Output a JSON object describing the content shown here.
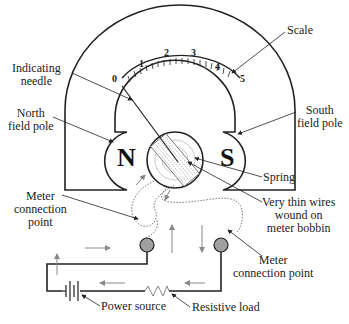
{
  "labels": {
    "scale": "Scale",
    "indicating_needle": [
      "Indicating",
      "needle"
    ],
    "north_field_pole": [
      "North",
      "field pole"
    ],
    "south_field_pole": [
      "South",
      "field pole"
    ],
    "spring": "Spring",
    "thin_wires": [
      "Very thin wires",
      "wound on",
      "meter bobbin"
    ],
    "meter_connection_left": [
      "Meter",
      "connection",
      "point"
    ],
    "meter_connection_right": [
      "Meter",
      "connection point"
    ],
    "power_source": "Power source",
    "resistive_load": "Resistive load"
  },
  "poles": {
    "north": "N",
    "south": "S"
  },
  "scale_ticks": [
    "0",
    "1",
    "2",
    "3",
    "4",
    "5"
  ],
  "colors": {
    "line": "#222222",
    "arrow_gray": "#888888",
    "terminal_fill": "#a0a0a0"
  }
}
